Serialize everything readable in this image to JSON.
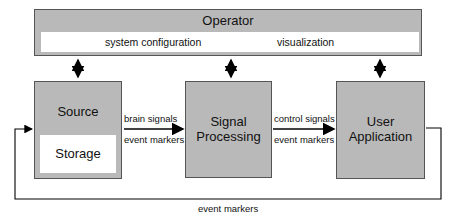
{
  "operator": {
    "title": "Operator",
    "items": [
      "system configuration",
      "visualization"
    ]
  },
  "source": {
    "title": "Source",
    "sub": "Storage"
  },
  "processing": {
    "title_line1": "Signal",
    "title_line2": "Processing"
  },
  "application": {
    "title_line1": "User",
    "title_line2": "Application"
  },
  "links": {
    "src_to_proc": [
      "brain signals",
      "event markers"
    ],
    "proc_to_app": [
      "control signals",
      "event markers"
    ],
    "feedback": "event markers"
  },
  "colors": {
    "box_fill": "#b9b9b9",
    "border": "#555555"
  }
}
